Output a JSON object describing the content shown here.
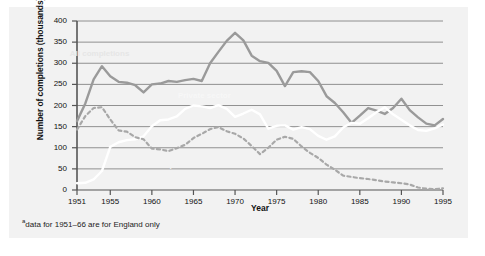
{
  "chart_data": {
    "type": "line",
    "title": "",
    "xlabel": "Year",
    "ylabel": "Number of completions (thousands)",
    "xlim": [
      1951,
      1995
    ],
    "ylim": [
      0,
      400
    ],
    "grid": true,
    "legend_position": "inline-labels",
    "ytick_labels": [
      "0",
      "50",
      "100",
      "150",
      "200",
      "250",
      "300",
      "350",
      "400"
    ],
    "ytick_values": [
      0,
      50,
      100,
      150,
      200,
      250,
      300,
      350,
      400
    ],
    "xtick_labels": [
      "1951",
      "1955",
      "1960",
      "1965",
      "1970",
      "1975",
      "1980",
      "1985",
      "1990",
      "1995"
    ],
    "xtick_values": [
      1951,
      1955,
      1960,
      1965,
      1970,
      1975,
      1980,
      1985,
      1990,
      1995
    ],
    "footnote": "data for 1951–66 are for England only",
    "footnote_marker": "a",
    "x": [
      1951,
      1952,
      1953,
      1954,
      1955,
      1956,
      1957,
      1958,
      1959,
      1960,
      1961,
      1962,
      1963,
      1964,
      1965,
      1966,
      1967,
      1968,
      1969,
      1970,
      1971,
      1972,
      1973,
      1974,
      1975,
      1976,
      1977,
      1978,
      1979,
      1980,
      1981,
      1982,
      1983,
      1984,
      1985,
      1986,
      1987,
      1988,
      1989,
      1990,
      1991,
      1992,
      1993,
      1994,
      1995
    ],
    "series": [
      {
        "name": "All completions",
        "style": "solid",
        "color": "#9a9a9a",
        "label_x": 1953.5,
        "label_y": 322,
        "values": [
          163,
          205,
          262,
          293,
          269,
          256,
          254,
          248,
          231,
          250,
          252,
          258,
          256,
          260,
          263,
          258,
          300,
          327,
          353,
          372,
          354,
          318,
          305,
          301,
          282,
          246,
          279,
          281,
          279,
          258,
          222,
          206,
          184,
          159,
          176,
          194,
          188,
          180,
          194,
          216,
          189,
          172,
          157,
          153,
          168
        ]
      },
      {
        "name": "Private sector",
        "style": "solid",
        "color": "#ffffff",
        "label_x": 1966.5,
        "label_y": 222,
        "values": [
          16,
          17,
          25,
          45,
          102,
          113,
          118,
          120,
          127,
          151,
          165,
          167,
          174,
          192,
          200,
          198,
          194,
          201,
          192,
          173,
          181,
          190,
          179,
          145,
          152,
          153,
          143,
          149,
          144,
          128,
          119,
          127,
          148,
          159,
          157,
          170,
          184,
          196,
          179,
          166,
          153,
          142,
          140,
          146,
          155
        ]
      },
      {
        "name": "All public sector",
        "style": "dashed",
        "color": "#a8a8a8",
        "label_x": 1964.0,
        "label_y": 58,
        "values": [
          143,
          175,
          194,
          196,
          167,
          141,
          138,
          125,
          120,
          98,
          96,
          92,
          99,
          107,
          123,
          133,
          144,
          149,
          139,
          133,
          122,
          104,
          85,
          100,
          119,
          126,
          121,
          103,
          88,
          76,
          60,
          48,
          34,
          31,
          28,
          26,
          23,
          20,
          18,
          16,
          13,
          6,
          3,
          2,
          4
        ]
      }
    ]
  },
  "labels": {
    "all_completions": "All completions",
    "private_sector": "Private sector",
    "public_sector": "All public sector"
  }
}
